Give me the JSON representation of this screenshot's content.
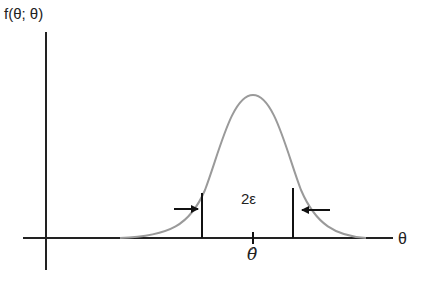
{
  "diagram": {
    "y_axis_label": "f(θ; θ)",
    "x_axis_label": "θ",
    "interval_label": "2ε",
    "estimate_label": "θ̂",
    "colors": {
      "axes": "#222222",
      "curve": "#9a9a9a",
      "markers": "#111111"
    },
    "elements": [
      {
        "type": "axis",
        "name": "vertical-axis"
      },
      {
        "type": "axis",
        "name": "horizontal-axis"
      },
      {
        "type": "curve",
        "name": "bell-curve",
        "shape": "normal density"
      },
      {
        "type": "line",
        "name": "left-bound"
      },
      {
        "type": "line",
        "name": "right-bound"
      },
      {
        "type": "arrow",
        "name": "left-arrow",
        "direction": "right"
      },
      {
        "type": "arrow",
        "name": "right-arrow",
        "direction": "left"
      },
      {
        "type": "tick",
        "name": "center-tick"
      }
    ]
  }
}
